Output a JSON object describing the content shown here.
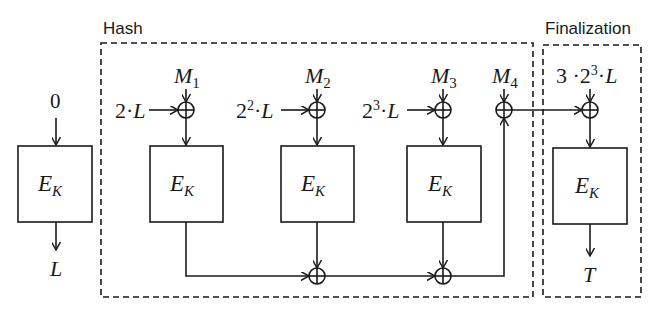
{
  "diagram": {
    "type": "block-cipher-mac-construction",
    "groups": {
      "hash": {
        "label": "Hash"
      },
      "finalization": {
        "label": "Finalization"
      }
    },
    "precompute": {
      "input": "0",
      "cipher": {
        "main": "E",
        "sub": "K"
      },
      "output": "L"
    },
    "messages": [
      {
        "main": "M",
        "sub": "1"
      },
      {
        "main": "M",
        "sub": "2"
      },
      {
        "main": "M",
        "sub": "3"
      },
      {
        "main": "M",
        "sub": "4"
      }
    ],
    "masks": [
      {
        "coef": "2",
        "exp": "",
        "var": "L"
      },
      {
        "coef": "2",
        "exp": "2",
        "var": "L"
      },
      {
        "coef": "2",
        "exp": "3",
        "var": "L"
      }
    ],
    "final_mask": {
      "prefix": "3 ",
      "coef": "2",
      "exp": "3",
      "var": "L"
    },
    "cipher_blocks": [
      {
        "main": "E",
        "sub": "K"
      },
      {
        "main": "E",
        "sub": "K"
      },
      {
        "main": "E",
        "sub": "K"
      },
      {
        "main": "E",
        "sub": "K"
      }
    ],
    "output": "T",
    "dot": "·",
    "colors": {
      "stroke": "#1a1a1a",
      "background": "#ffffff"
    }
  }
}
